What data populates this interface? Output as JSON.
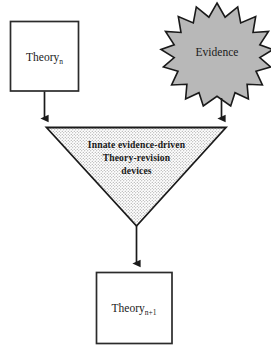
{
  "diagram": {
    "background_color": "#ffffff",
    "line_color": "#1a1a1a",
    "nodes": {
      "theory_n": {
        "label": "Theory",
        "subscript": "n",
        "shape": "rectangle",
        "fill_color": "#ffffff",
        "stroke_color": "#2b2b2b"
      },
      "evidence": {
        "label": "Evidence",
        "shape": "starburst",
        "points": 17,
        "fill_color": "#b8b8b8",
        "stroke_color": "#1a1a1a"
      },
      "devices": {
        "line1": "Innate  evidence-driven",
        "line2": "Theory-revision",
        "line3": "devices",
        "shape": "inverted-triangle",
        "fill_color": "#ffffff",
        "fill_pattern": "stipple-dots",
        "pattern_color": "#8a8a8a",
        "stroke_color": "#1a1a1a"
      },
      "theory_n_plus_1": {
        "label": "Theory",
        "subscript": "n+1",
        "shape": "rectangle",
        "fill_color": "#ffffff",
        "stroke_color": "#2b2b2b"
      }
    },
    "edges": [
      {
        "name": "theory-n-to-devices",
        "from": "theory_n",
        "to": "devices",
        "arrowhead": "solid"
      },
      {
        "name": "evidence-to-devices",
        "from": "evidence",
        "to": "devices",
        "arrowhead": "solid"
      },
      {
        "name": "devices-to-theory-n-plus-1",
        "from": "devices",
        "to": "theory_n_plus_1",
        "arrowhead": "solid"
      }
    ]
  }
}
